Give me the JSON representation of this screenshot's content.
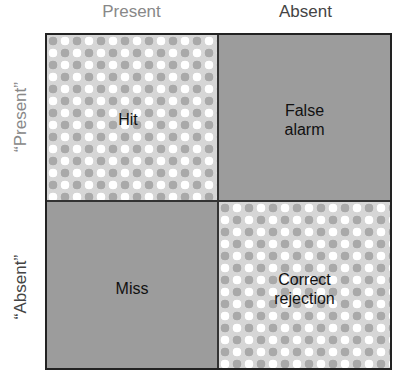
{
  "columns": [
    "Present",
    "Absent"
  ],
  "rows": [
    "“Present”",
    "“Absent”"
  ],
  "cells": {
    "hit": "Hit",
    "false_alarm_1": "False",
    "false_alarm_2": "alarm",
    "miss": "Miss",
    "correct_rejection_1": "Correct",
    "correct_rejection_2": "rejection"
  },
  "colors": {
    "border": "#222222",
    "solid_fill": "#9c9c9c",
    "pattern_light": "#d6d6d6",
    "pattern_dot_grey": "#a9a9a9",
    "pattern_dot_white": "#ffffff"
  }
}
